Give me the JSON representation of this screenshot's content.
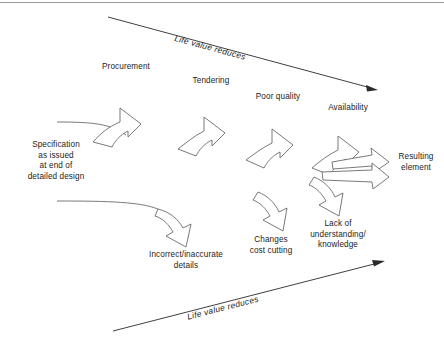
{
  "diagram": {
    "title_top_axis": "Life value reduces",
    "title_bottom_axis": "Life value reduces",
    "source_label": "Specification\nas issued\nat end of\ndetailed design",
    "result_label": "Resulting\nelement",
    "upper_stages": [
      {
        "label": "Procurement"
      },
      {
        "label": "Tendering"
      },
      {
        "label": "Poor quality"
      },
      {
        "label": "Availability"
      }
    ],
    "lower_stages": [
      {
        "label": "Incorrect/inaccurate\ndetails"
      },
      {
        "label": "Changes\ncost cutting"
      },
      {
        "label": "Lack of\nunderstanding/\nknowledge"
      }
    ],
    "colors": {
      "stroke": "#55555a",
      "text": "#1c1c1c",
      "axis": "#2a2a2a",
      "border": "#9a9a9a",
      "background": "#ffffff"
    }
  }
}
